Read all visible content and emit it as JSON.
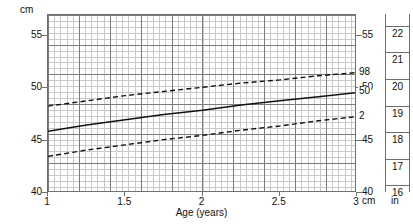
{
  "chart_data": {
    "type": "line",
    "title": "",
    "xlabel": "Age (years)",
    "ylabel": "cm",
    "xlim": [
      1,
      3
    ],
    "ylim": [
      40,
      57
    ],
    "grid": true,
    "legend_position": "right-inline-labels",
    "x_ticks": [
      "1",
      "1.5",
      "2",
      "2.5",
      "3"
    ],
    "x_tick_values": [
      1,
      1.5,
      2,
      2.5,
      3
    ],
    "y_ticks_cm": [
      "55",
      "50",
      "45",
      "40"
    ],
    "y_tick_values_cm": [
      55,
      50,
      45,
      40
    ],
    "y_ticks_in": [
      "22",
      "21",
      "20",
      "19",
      "18",
      "17",
      "16"
    ],
    "y_tick_values_in": [
      22,
      21,
      20,
      19,
      18,
      17,
      16
    ],
    "left_unit": "cm",
    "right_unit_cm": "cm",
    "right_unit_in": "in",
    "x": [
      1,
      1.25,
      1.5,
      1.75,
      2,
      2.25,
      2.5,
      2.75,
      3
    ],
    "series": [
      {
        "name": "98",
        "label": "98",
        "style": "dashed",
        "values": [
          48.3,
          48.8,
          49.3,
          49.7,
          50.1,
          50.5,
          50.8,
          51.2,
          51.5
        ]
      },
      {
        "name": "50",
        "label": "50",
        "style": "solid",
        "values": [
          45.9,
          46.5,
          47.0,
          47.5,
          47.9,
          48.4,
          48.8,
          49.2,
          49.6
        ]
      },
      {
        "name": "2",
        "label": "2",
        "style": "dashed",
        "values": [
          43.5,
          44.1,
          44.6,
          45.1,
          45.5,
          46.0,
          46.4,
          46.9,
          47.3
        ]
      }
    ]
  },
  "axes": {
    "left_unit_label": "cm",
    "x_title": "Age (years)",
    "right_cm_label": "cm",
    "right_in_label": "in"
  }
}
